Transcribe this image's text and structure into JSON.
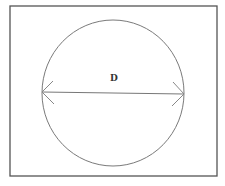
{
  "diagram": {
    "label": "D",
    "colors": {
      "background": "#ffffff",
      "frame": "#555555",
      "circle": "#777777",
      "arrow": "#777777",
      "text": "#333333"
    },
    "shapes": {
      "frame": {
        "x": 10,
        "y": 6,
        "width": 207,
        "height": 170
      },
      "circle": {
        "cx": 113,
        "cy": 93,
        "rx": 71,
        "ry": 73
      },
      "diameter_line": {
        "x1": 42,
        "y1": 92,
        "x2": 184,
        "y2": 94
      }
    }
  }
}
